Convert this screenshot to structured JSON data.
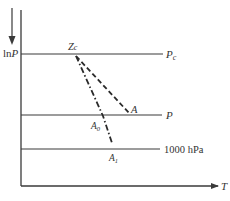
{
  "diagram": {
    "colors": {
      "line": "#3a3a3a",
      "text": "#333333",
      "background": "#ffffff"
    },
    "axes": {
      "y_label": "lnP",
      "y_label_main": "ln",
      "y_label_var": "P",
      "x_label": "T",
      "y_direction_arrow": "down-arrow"
    },
    "levels": [
      {
        "id": "pc",
        "label_main": "P",
        "label_sub": "c",
        "y": 54
      },
      {
        "id": "p",
        "label_main": "P",
        "label_sub": "",
        "y": 115
      },
      {
        "id": "p1000",
        "label_main": "1000 hPa",
        "label_sub": "",
        "y": 149
      }
    ],
    "points": {
      "zc": {
        "label_main": "Z",
        "label_sub": "c"
      },
      "a": {
        "label_main": "A",
        "label_sub": ""
      },
      "a0": {
        "label_main": "A",
        "label_sub": "0"
      },
      "a1": {
        "label_main": "A",
        "label_sub": "1"
      }
    },
    "curves": [
      {
        "id": "dashed",
        "from": "Zc",
        "to": "A",
        "style": "dashed"
      },
      {
        "id": "dash-dot",
        "from": "Zc",
        "through": "A0",
        "to": "A1",
        "style": "dash-dot"
      }
    ]
  }
}
